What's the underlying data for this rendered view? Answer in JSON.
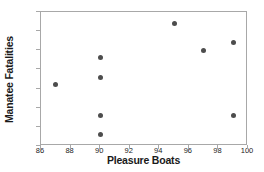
{
  "chart_data": {
    "type": "scatter",
    "title": "",
    "xlabel": "Pleasure Boats",
    "ylabel": "Manatee Fatalities",
    "xlim": [
      86,
      100
    ],
    "ylim": [
      65,
      100
    ],
    "xticks": [
      86,
      88,
      90,
      92,
      94,
      96,
      98,
      100
    ],
    "yticks": [
      65,
      70,
      75,
      80,
      85,
      90,
      95,
      100
    ],
    "grid": false,
    "legend": null,
    "marker_color": "#4d4d4d",
    "frame_color": "#a8a8a8",
    "points": [
      {
        "x": 87,
        "y": 81
      },
      {
        "x": 90,
        "y": 88
      },
      {
        "x": 90,
        "y": 83
      },
      {
        "x": 90,
        "y": 73
      },
      {
        "x": 90,
        "y": 68
      },
      {
        "x": 95,
        "y": 97
      },
      {
        "x": 97,
        "y": 90
      },
      {
        "x": 99,
        "y": 92
      },
      {
        "x": 99,
        "y": 73
      }
    ]
  }
}
